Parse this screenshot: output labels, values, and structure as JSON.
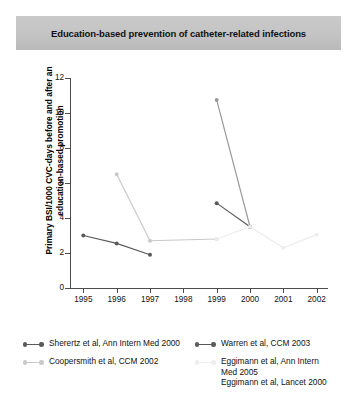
{
  "title": "Education-based prevention of catheter-related infections",
  "colors": {
    "sherertz": "#5a5a5a",
    "warren": "#5a5a5a",
    "coopersmith": "#c9c9c9",
    "eggimann_dark": "#9a9a9a",
    "eggimann_light": "#ededed",
    "axis": "#4d4d4d",
    "banner": "#c4c4c4"
  },
  "legend": {
    "entries": [
      {
        "label": "Sherertz et al, Ann Intern Med 2000",
        "marker": "line-dot-marker",
        "color": "#5a5a5a"
      },
      {
        "label": "Coopersmith et al, CCM 2002",
        "marker": "line-dot-marker",
        "color": "#c9c9c9"
      },
      {
        "label": "Warren et al, CCM 2003",
        "marker": "line-dot-marker",
        "color": "#5a5a5a"
      },
      {
        "label": "Eggimann et al, Ann Intern\nMed 2005\nEggimann et al, Lancet 2000",
        "marker": "line-dot-marker",
        "color": "#ededed"
      }
    ]
  },
  "chart_data": {
    "type": "line",
    "title": "Education-based prevention of catheter-related infections",
    "xlabel": "",
    "ylabel": "Primary BSI/1000 CVC-days before and after an education-based promotion",
    "xlim": [
      1994.6,
      2002.4
    ],
    "ylim": [
      0,
      12
    ],
    "yticks": [
      0,
      2,
      4,
      6,
      8,
      10,
      12
    ],
    "xticks": [
      1995,
      1996,
      1997,
      1998,
      1999,
      2000,
      2001,
      2002
    ],
    "grid": false,
    "legend_position": "below",
    "series": [
      {
        "name": "Sherertz et al, Ann Intern Med 2000",
        "color": "#5a5a5a",
        "x": [
          1995,
          1996,
          1997
        ],
        "values": [
          3.0,
          2.55,
          1.9
        ]
      },
      {
        "name": "Coopersmith et al, CCM 2002",
        "color": "#c9c9c9",
        "x": [
          1996,
          1997,
          1999
        ],
        "values": [
          6.5,
          2.7,
          2.8
        ]
      },
      {
        "name": "Warren et al, CCM 2003",
        "color": "#5a5a5a",
        "x": [
          1999,
          2000
        ],
        "values": [
          4.85,
          3.5
        ]
      },
      {
        "name": "Eggimann et al, Ann Intern Med 2005",
        "color": "#9a9a9a",
        "x": [
          1999,
          2000
        ],
        "values": [
          10.75,
          3.5
        ]
      },
      {
        "name": "Eggimann et al, Lancet 2000",
        "color": "#ededed",
        "x": [
          1999,
          2000,
          2001,
          2002
        ],
        "values": [
          2.8,
          3.5,
          2.3,
          3.05
        ]
      }
    ]
  }
}
